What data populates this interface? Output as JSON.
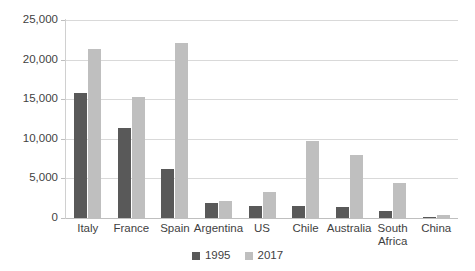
{
  "chart_data": {
    "type": "bar",
    "title": "",
    "subtitle": "",
    "xlabel": "",
    "ylabel": "",
    "ylim": [
      0,
      25000
    ],
    "ytick_labels": [
      "0",
      "5,000",
      "10,000",
      "15,000",
      "20,000",
      "25,000"
    ],
    "ytick_values": [
      0,
      5000,
      10000,
      15000,
      20000,
      25000
    ],
    "grid": true,
    "legend_position": "bottom",
    "categories": [
      "Italy",
      "France",
      "Spain",
      "Argentina",
      "US",
      "Chile",
      "Australia",
      "South\nAfrica",
      "China"
    ],
    "series": [
      {
        "name": "1995",
        "color": "#595959",
        "values": [
          15800,
          11400,
          6200,
          1900,
          1500,
          1500,
          1400,
          900,
          100
        ]
      },
      {
        "name": "2017",
        "color": "#bfbfbf",
        "values": [
          21400,
          15300,
          22100,
          2200,
          3300,
          9700,
          7900,
          4400,
          400
        ]
      }
    ]
  },
  "legend": {
    "items": [
      {
        "label": "1995",
        "color": "#595959"
      },
      {
        "label": "2017",
        "color": "#bfbfbf"
      }
    ]
  },
  "colors": {
    "series_1995": "#595959",
    "series_2017": "#bfbfbf",
    "gridline": "#d9d9d9",
    "axis": "#bfbfbf",
    "text": "#3f3f3f",
    "background": "#ffffff"
  }
}
